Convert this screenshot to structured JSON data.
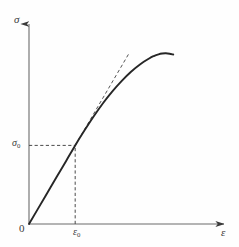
{
  "figure": {
    "kind": "stress-strain-diagram",
    "background_color": "#fefefe",
    "ink_color": "#3a3a3a",
    "curve_color": "#2b2b2b",
    "dash_color": "#4a4a4a"
  },
  "labels": {
    "y_axis": "σ",
    "x_axis": "ε",
    "origin": "0",
    "yield_stress": "σ",
    "yield_stress_sub": "0",
    "yield_strain": "ε",
    "yield_strain_sub": "0"
  },
  "chart_data": {
    "type": "line",
    "title": "",
    "xlabel": "ε",
    "ylabel": "σ",
    "grid": false,
    "legend": null,
    "axis_origin_label": "0",
    "xlim": [
      0,
      1
    ],
    "ylim": [
      0,
      1
    ],
    "tick_labels": {
      "x": [
        "ε0"
      ],
      "y": [
        "σ0"
      ]
    },
    "annotations": [
      {
        "name": "proportional-limit-point",
        "x": 0.251,
        "y": 0.397,
        "label_x": "ε0",
        "label_y": "σ0"
      }
    ],
    "series": [
      {
        "name": "stress-strain-curve",
        "style": "solid",
        "points": [
          [
            0.0,
            0.0
          ],
          [
            0.05,
            0.079
          ],
          [
            0.1,
            0.158
          ],
          [
            0.15,
            0.237
          ],
          [
            0.201,
            0.317
          ],
          [
            0.251,
            0.397
          ],
          [
            0.302,
            0.473
          ],
          [
            0.352,
            0.544
          ],
          [
            0.402,
            0.61
          ],
          [
            0.452,
            0.669
          ],
          [
            0.503,
            0.722
          ],
          [
            0.553,
            0.768
          ],
          [
            0.603,
            0.806
          ],
          [
            0.653,
            0.836
          ],
          [
            0.678,
            0.848
          ],
          [
            0.704,
            0.857
          ],
          [
            0.724,
            0.861
          ],
          [
            0.744,
            0.862
          ],
          [
            0.764,
            0.86
          ],
          [
            0.784,
            0.856
          ]
        ]
      },
      {
        "name": "elastic-tangent-line",
        "style": "dashed",
        "points": [
          [
            0.251,
            0.397
          ],
          [
            0.543,
            0.861
          ]
        ]
      }
    ],
    "guides": [
      {
        "name": "horizontal-guide-to-sigma0",
        "style": "dashed",
        "from": [
          0.0,
          0.397
        ],
        "to": [
          0.251,
          0.397
        ]
      },
      {
        "name": "vertical-guide-to-epsilon0",
        "style": "dashed",
        "from": [
          0.251,
          0.0
        ],
        "to": [
          0.251,
          0.397
        ]
      }
    ]
  }
}
